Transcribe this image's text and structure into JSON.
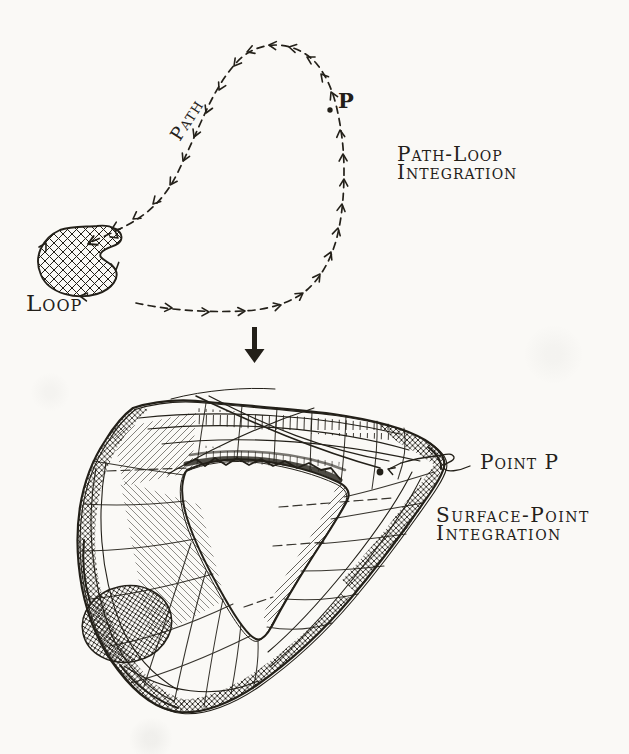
{
  "colors": {
    "ink": "#232019",
    "paper": "#faf9f6"
  },
  "top_figure": {
    "path_label": "Path",
    "point_label": "P",
    "loop_label": "Loop",
    "caption_line1": "Path-Loop",
    "caption_line2": "Integration"
  },
  "transition": {
    "icon": "down-arrow-icon"
  },
  "bottom_figure": {
    "point_label": "Point P",
    "caption_line1": "Surface-Point",
    "caption_line2": "Integration"
  }
}
